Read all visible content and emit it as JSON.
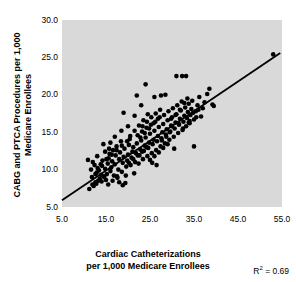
{
  "chart_data": {
    "type": "scatter",
    "title": "",
    "xlabel": "Cardiac Catheterizations per 1,000 Medicare Enrollees",
    "ylabel": "CABG and PTCA Procedures per 1,000 Medicare Enrollees",
    "xlim": [
      5.0,
      55.0
    ],
    "ylim": [
      5.0,
      30.0
    ],
    "xticks": [
      "5.0",
      "15.0",
      "25.0",
      "35.0",
      "45.0",
      "55.0"
    ],
    "xtick_values": [
      5.0,
      15.0,
      25.0,
      35.0,
      45.0,
      55.0
    ],
    "yticks": [
      "5.0",
      "10.0",
      "15.0",
      "20.0",
      "25.0",
      "30.0"
    ],
    "ytick_values": [
      5.0,
      10.0,
      15.0,
      20.0,
      25.0,
      30.0
    ],
    "grid": false,
    "legend": "none",
    "plot_background": "#d9d9d9",
    "marker_color": "#000000",
    "marker_shape": "circle",
    "marker_size_px": 4.6,
    "annotations": [
      {
        "name": "r-squared",
        "text": "R2 = 0.69",
        "value": 0.69,
        "position": "bottom-right"
      }
    ],
    "trendline": {
      "type": "linear",
      "color": "#000000",
      "width_px": 1.8,
      "x_start": 5.0,
      "y_start": 5.9,
      "x_end": 54.6,
      "y_end": 25.6,
      "slope": 0.397,
      "intercept": 3.92
    },
    "points": [
      [
        11.2,
        7.4
      ],
      [
        11.9,
        8.0
      ],
      [
        12.2,
        7.8
      ],
      [
        12.6,
        8.3
      ],
      [
        12.9,
        9.6
      ],
      [
        13.1,
        10.2
      ],
      [
        13.4,
        9.9
      ],
      [
        13.6,
        8.8
      ],
      [
        13.9,
        9.3
      ],
      [
        14.1,
        10.5
      ],
      [
        10.9,
        11.3
      ],
      [
        11.6,
        10.0
      ],
      [
        12.0,
        11.0
      ],
      [
        12.4,
        10.6
      ],
      [
        13.0,
        11.8
      ],
      [
        14.4,
        13.4
      ],
      [
        14.6,
        9.0
      ],
      [
        14.8,
        10.1
      ],
      [
        15.0,
        8.6
      ],
      [
        15.2,
        9.4
      ],
      [
        15.4,
        10.8
      ],
      [
        15.6,
        11.5
      ],
      [
        15.8,
        12.1
      ],
      [
        16.0,
        9.8
      ],
      [
        16.2,
        10.3
      ],
      [
        16.4,
        11.1
      ],
      [
        16.6,
        12.6
      ],
      [
        16.8,
        9.2
      ],
      [
        17.0,
        10.7
      ],
      [
        17.2,
        11.9
      ],
      [
        17.4,
        13.1
      ],
      [
        17.6,
        8.9
      ],
      [
        17.8,
        10.0
      ],
      [
        18.0,
        11.4
      ],
      [
        18.2,
        12.3
      ],
      [
        18.4,
        13.8
      ],
      [
        18.6,
        9.7
      ],
      [
        18.8,
        10.9
      ],
      [
        19.0,
        11.7
      ],
      [
        19.2,
        12.8
      ],
      [
        19.4,
        8.2
      ],
      [
        19.6,
        10.4
      ],
      [
        19.8,
        11.2
      ],
      [
        20.0,
        12.0
      ],
      [
        20.2,
        13.3
      ],
      [
        20.4,
        14.1
      ],
      [
        20.6,
        10.6
      ],
      [
        20.8,
        11.6
      ],
      [
        21.0,
        12.4
      ],
      [
        21.2,
        13.0
      ],
      [
        21.4,
        9.5
      ],
      [
        21.6,
        11.0
      ],
      [
        21.8,
        12.2
      ],
      [
        22.0,
        13.5
      ],
      [
        22.2,
        14.6
      ],
      [
        22.4,
        10.8
      ],
      [
        22.6,
        11.9
      ],
      [
        22.8,
        12.7
      ],
      [
        23.0,
        13.9
      ],
      [
        23.2,
        15.1
      ],
      [
        23.4,
        11.4
      ],
      [
        23.6,
        12.5
      ],
      [
        23.8,
        13.2
      ],
      [
        24.0,
        14.3
      ],
      [
        24.2,
        15.6
      ],
      [
        24.4,
        11.8
      ],
      [
        24.6,
        12.9
      ],
      [
        24.8,
        13.6
      ],
      [
        25.0,
        14.8
      ],
      [
        25.2,
        16.0
      ],
      [
        25.4,
        12.2
      ],
      [
        25.6,
        13.4
      ],
      [
        25.8,
        14.0
      ],
      [
        26.0,
        15.2
      ],
      [
        26.2,
        16.4
      ],
      [
        26.4,
        12.6
      ],
      [
        26.6,
        13.8
      ],
      [
        26.8,
        14.5
      ],
      [
        27.0,
        15.7
      ],
      [
        27.2,
        17.0
      ],
      [
        27.4,
        13.1
      ],
      [
        27.6,
        14.2
      ],
      [
        27.8,
        15.0
      ],
      [
        28.0,
        16.1
      ],
      [
        28.2,
        17.3
      ],
      [
        28.4,
        13.5
      ],
      [
        28.6,
        14.7
      ],
      [
        28.8,
        15.4
      ],
      [
        29.0,
        16.6
      ],
      [
        29.2,
        17.8
      ],
      [
        29.4,
        14.0
      ],
      [
        29.6,
        15.1
      ],
      [
        29.8,
        15.9
      ],
      [
        30.0,
        17.0
      ],
      [
        30.2,
        18.2
      ],
      [
        30.4,
        14.4
      ],
      [
        30.6,
        15.5
      ],
      [
        30.8,
        16.3
      ],
      [
        31.0,
        17.4
      ],
      [
        31.2,
        18.6
      ],
      [
        31.4,
        14.9
      ],
      [
        31.6,
        16.0
      ],
      [
        31.8,
        16.8
      ],
      [
        32.0,
        17.9
      ],
      [
        32.2,
        19.1
      ],
      [
        32.4,
        15.3
      ],
      [
        32.6,
        16.4
      ],
      [
        32.8,
        17.2
      ],
      [
        33.0,
        18.3
      ],
      [
        33.2,
        15.8
      ],
      [
        33.4,
        16.9
      ],
      [
        33.6,
        17.7
      ],
      [
        33.8,
        18.8
      ],
      [
        34.0,
        16.2
      ],
      [
        34.2,
        17.3
      ],
      [
        34.4,
        18.1
      ],
      [
        34.6,
        19.2
      ],
      [
        35.0,
        16.7
      ],
      [
        35.4,
        17.8
      ],
      [
        35.8,
        18.6
      ],
      [
        36.2,
        19.7
      ],
      [
        36.6,
        17.1
      ],
      [
        37.0,
        18.2
      ],
      [
        37.4,
        19.0
      ],
      [
        38.0,
        20.1
      ],
      [
        19.0,
        17.6
      ],
      [
        21.5,
        17.2
      ],
      [
        22.0,
        19.9
      ],
      [
        24.0,
        21.4
      ],
      [
        23.0,
        18.6
      ],
      [
        26.0,
        19.7
      ],
      [
        27.5,
        19.9
      ],
      [
        28.5,
        20.0
      ],
      [
        31.0,
        22.5
      ],
      [
        32.3,
        22.5
      ],
      [
        33.2,
        22.5
      ],
      [
        38.5,
        20.8
      ],
      [
        39.2,
        18.7
      ],
      [
        39.5,
        18.5
      ],
      [
        53.0,
        25.4
      ],
      [
        26.5,
        10.6
      ],
      [
        25.5,
        10.9
      ],
      [
        35.0,
        13.1
      ],
      [
        34.0,
        16.5
      ],
      [
        30.5,
        12.8
      ],
      [
        20.0,
        15.8
      ],
      [
        18.5,
        15.2
      ],
      [
        17.0,
        14.4
      ],
      [
        16.0,
        13.6
      ],
      [
        14.8,
        12.4
      ],
      [
        24.5,
        17.4
      ],
      [
        23.5,
        16.6
      ],
      [
        22.5,
        15.9
      ],
      [
        21.5,
        15.2
      ],
      [
        20.5,
        14.5
      ],
      [
        29.0,
        13.4
      ],
      [
        28.0,
        12.9
      ],
      [
        27.0,
        12.3
      ],
      [
        26.0,
        11.8
      ],
      [
        25.0,
        11.3
      ],
      [
        12.8,
        8.1
      ],
      [
        13.2,
        8.5
      ],
      [
        14.0,
        8.4
      ],
      [
        14.5,
        9.1
      ],
      [
        15.5,
        8.0
      ],
      [
        16.5,
        8.5
      ],
      [
        17.5,
        9.1
      ],
      [
        18.0,
        8.3
      ],
      [
        19.5,
        9.2
      ],
      [
        18.8,
        7.9
      ],
      [
        30.0,
        15.8
      ],
      [
        31.5,
        16.2
      ],
      [
        29.5,
        15.0
      ],
      [
        28.7,
        14.4
      ],
      [
        27.7,
        13.9
      ],
      [
        24.2,
        13.0
      ],
      [
        23.2,
        12.4
      ],
      [
        22.2,
        11.9
      ],
      [
        21.2,
        11.4
      ],
      [
        20.2,
        10.9
      ],
      [
        33.5,
        19.5
      ],
      [
        32.8,
        18.9
      ],
      [
        31.8,
        18.0
      ],
      [
        30.8,
        17.3
      ],
      [
        29.8,
        16.8
      ],
      [
        19.8,
        13.8
      ],
      [
        18.6,
        13.2
      ],
      [
        17.4,
        12.6
      ],
      [
        16.3,
        12.0
      ],
      [
        15.1,
        11.4
      ],
      [
        26.8,
        16.8
      ],
      [
        25.8,
        16.2
      ],
      [
        24.8,
        15.5
      ],
      [
        23.8,
        14.9
      ],
      [
        22.8,
        14.3
      ],
      [
        35.5,
        17.0
      ],
      [
        36.0,
        18.0
      ],
      [
        34.8,
        17.6
      ],
      [
        33.8,
        16.3
      ],
      [
        32.5,
        15.5
      ],
      [
        13.8,
        10.7
      ],
      [
        12.6,
        9.4
      ],
      [
        11.8,
        9.0
      ],
      [
        14.2,
        11.2
      ],
      [
        15.7,
        12.8
      ],
      [
        27.3,
        18.0
      ],
      [
        26.3,
        17.5
      ],
      [
        25.3,
        17.0
      ],
      [
        24.3,
        16.4
      ],
      [
        23.3,
        15.8
      ]
    ]
  },
  "annotation_text": {
    "r2_label": "R",
    "r2_sup": "2",
    "r2_value": " = 0.69"
  },
  "axis_titles": {
    "x_line1": "Cardiac Catheterizations",
    "x_line2": "per 1,000 Medicare Enrollees",
    "y_full": "CABG and PTCA Procedures per 1,000 Medicare Enrollees"
  }
}
